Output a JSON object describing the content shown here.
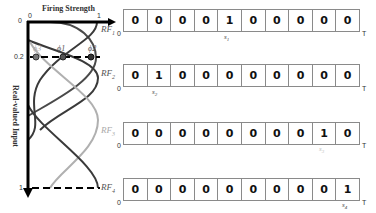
{
  "figure": {
    "x_axis_title": "Firing Strength",
    "y_axis_title": "Real-valued Input",
    "x_ticks": [
      "0",
      "1"
    ],
    "y_ticks": [
      "0",
      "0.2",
      "1"
    ],
    "phi_labels": [
      "ϕ3",
      "ϕ1",
      "ϕ2"
    ],
    "colors": {
      "dark": "#3a3a3a",
      "mid": "#5a5a5a",
      "light": "#b0b0b0",
      "axis": "#000000"
    }
  },
  "rows": [
    {
      "rf_label": "RF",
      "rf_sub": "1",
      "start": "0",
      "end": "T",
      "cells": [
        "0",
        "0",
        "0",
        "0",
        "1",
        "0",
        "0",
        "0",
        "0",
        "0"
      ],
      "spike_label": "s",
      "spike_sub": "1",
      "spike_index": 4,
      "light": false
    },
    {
      "rf_label": "RF",
      "rf_sub": "2",
      "start": "0",
      "end": "T",
      "cells": [
        "0",
        "1",
        "0",
        "0",
        "0",
        "0",
        "0",
        "0",
        "0",
        "0"
      ],
      "spike_label": "s",
      "spike_sub": "2",
      "spike_index": 1,
      "light": false
    },
    {
      "rf_label": "RF",
      "rf_sub": "3",
      "start": "0",
      "end": "T",
      "cells": [
        "0",
        "0",
        "0",
        "0",
        "0",
        "0",
        "0",
        "0",
        "1",
        "0"
      ],
      "spike_label": "s",
      "spike_sub": "3",
      "spike_index": 8,
      "light": true
    },
    {
      "rf_label": "RF",
      "rf_sub": "4",
      "start": "0",
      "end": "T",
      "cells": [
        "0",
        "0",
        "0",
        "0",
        "0",
        "0",
        "0",
        "0",
        "0",
        "1"
      ],
      "spike_label": "s",
      "spike_sub": "4",
      "spike_index": 9,
      "light": false
    }
  ]
}
